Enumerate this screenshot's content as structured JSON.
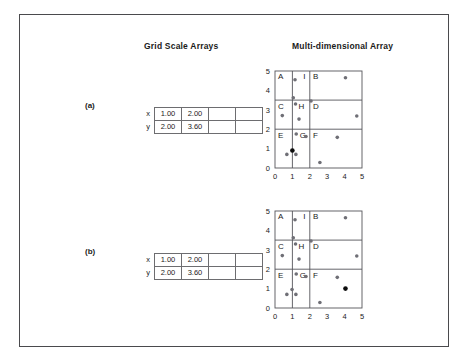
{
  "figure": {
    "headers": {
      "grid_scale": "Grid Scale Arrays",
      "multi_dimensional": "Multi-dimensional Array"
    },
    "panels": [
      {
        "label": "(a)",
        "table": {
          "rows": [
            {
              "name": "x",
              "cells": [
                "1.00",
                "2.00",
                "",
                ""
              ]
            },
            {
              "name": "y",
              "cells": [
                "2.00",
                "3.60",
                "",
                ""
              ]
            }
          ]
        },
        "chart_key": 0
      },
      {
        "label": "(b)",
        "table": {
          "rows": [
            {
              "name": "x",
              "cells": [
                "1.00",
                "2.00",
                "",
                ""
              ]
            },
            {
              "name": "y",
              "cells": [
                "2.00",
                "3.60",
                "",
                ""
              ]
            }
          ]
        },
        "chart_key": 1
      }
    ]
  },
  "chart_data": [
    {
      "type": "scatter",
      "title": "Multi-dimensional Array",
      "panel": "(a)",
      "xlabel": "",
      "ylabel": "",
      "xlim": [
        0,
        5
      ],
      "ylim": [
        0,
        5
      ],
      "xticks": [
        "0",
        "1",
        "2",
        "3",
        "4",
        "5"
      ],
      "yticks": [
        "0",
        "1",
        "2",
        "3",
        "4",
        "5"
      ],
      "grid": false,
      "grid_lines_x": [
        1,
        2
      ],
      "grid_lines_y": [
        2,
        3.5
      ],
      "cell_labels": [
        {
          "text": "A",
          "x": 0.1,
          "y": 4.85
        },
        {
          "text": "I",
          "x": 1.55,
          "y": 4.85
        },
        {
          "text": "B",
          "x": 2.12,
          "y": 4.85
        },
        {
          "text": "C",
          "x": 0.1,
          "y": 3.35
        },
        {
          "text": "H",
          "x": 1.28,
          "y": 3.35
        },
        {
          "text": "D",
          "x": 2.12,
          "y": 3.35
        },
        {
          "text": "E",
          "x": 0.1,
          "y": 1.85
        },
        {
          "text": "G",
          "x": 1.35,
          "y": 1.85
        },
        {
          "text": "F",
          "x": 2.12,
          "y": 1.85
        }
      ],
      "points": [
        {
          "x": 1.15,
          "y": 4.55,
          "filled": false
        },
        {
          "x": 4.05,
          "y": 4.65,
          "filled": false
        },
        {
          "x": 1.05,
          "y": 3.62,
          "filled": false
        },
        {
          "x": 1.18,
          "y": 3.3,
          "filled": false
        },
        {
          "x": 2.07,
          "y": 3.45,
          "filled": false
        },
        {
          "x": 0.42,
          "y": 2.7,
          "filled": false
        },
        {
          "x": 1.38,
          "y": 2.52,
          "filled": false
        },
        {
          "x": 4.7,
          "y": 2.68,
          "filled": false
        },
        {
          "x": 1.22,
          "y": 1.75,
          "filled": false
        },
        {
          "x": 1.78,
          "y": 1.62,
          "filled": false
        },
        {
          "x": 3.58,
          "y": 1.58,
          "filled": false
        },
        {
          "x": 0.68,
          "y": 0.7,
          "filled": false
        },
        {
          "x": 1.2,
          "y": 0.7,
          "filled": false
        },
        {
          "x": 1.0,
          "y": 0.9,
          "filled": true
        },
        {
          "x": 2.58,
          "y": 0.28,
          "filled": false
        }
      ],
      "highlighted_point": {
        "x": 1.0,
        "y": 0.9
      }
    },
    {
      "type": "scatter",
      "title": "Multi-dimensional Array",
      "panel": "(b)",
      "xlabel": "",
      "ylabel": "",
      "xlim": [
        0,
        5
      ],
      "ylim": [
        0,
        5
      ],
      "xticks": [
        "0",
        "1",
        "2",
        "3",
        "4",
        "5"
      ],
      "yticks": [
        "0",
        "1",
        "2",
        "3",
        "4",
        "5"
      ],
      "grid": false,
      "grid_lines_x": [
        1,
        2
      ],
      "grid_lines_y": [
        2,
        3.5
      ],
      "cell_labels": [
        {
          "text": "A",
          "x": 0.1,
          "y": 4.85
        },
        {
          "text": "I",
          "x": 1.55,
          "y": 4.85
        },
        {
          "text": "B",
          "x": 2.12,
          "y": 4.85
        },
        {
          "text": "C",
          "x": 0.1,
          "y": 3.35
        },
        {
          "text": "H",
          "x": 1.28,
          "y": 3.35
        },
        {
          "text": "D",
          "x": 2.12,
          "y": 3.35
        },
        {
          "text": "E",
          "x": 0.1,
          "y": 1.85
        },
        {
          "text": "G",
          "x": 1.35,
          "y": 1.85
        },
        {
          "text": "F",
          "x": 2.12,
          "y": 1.85
        }
      ],
      "points": [
        {
          "x": 1.15,
          "y": 4.55,
          "filled": false
        },
        {
          "x": 4.05,
          "y": 4.65,
          "filled": false
        },
        {
          "x": 1.05,
          "y": 3.62,
          "filled": false
        },
        {
          "x": 1.18,
          "y": 3.3,
          "filled": false
        },
        {
          "x": 2.07,
          "y": 3.45,
          "filled": false
        },
        {
          "x": 0.42,
          "y": 2.7,
          "filled": false
        },
        {
          "x": 1.38,
          "y": 2.52,
          "filled": false
        },
        {
          "x": 4.7,
          "y": 2.68,
          "filled": false
        },
        {
          "x": 1.22,
          "y": 1.75,
          "filled": false
        },
        {
          "x": 1.78,
          "y": 1.62,
          "filled": false
        },
        {
          "x": 3.58,
          "y": 1.58,
          "filled": false
        },
        {
          "x": 0.68,
          "y": 0.7,
          "filled": false
        },
        {
          "x": 0.98,
          "y": 0.95,
          "filled": false
        },
        {
          "x": 1.2,
          "y": 0.7,
          "filled": false
        },
        {
          "x": 4.05,
          "y": 1.0,
          "filled": true
        },
        {
          "x": 2.58,
          "y": 0.28,
          "filled": false
        }
      ],
      "highlighted_point": {
        "x": 4.05,
        "y": 1.0
      }
    }
  ],
  "colors": {
    "frame": "#4a4a4d",
    "grid_line": "#55555a",
    "point_open": "#6f6f76",
    "point_filled": "#0d0d0d",
    "text": "#1b1b1b"
  }
}
